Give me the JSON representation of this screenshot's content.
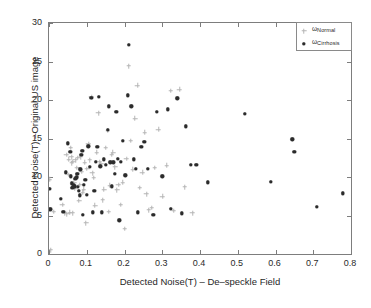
{
  "figure": {
    "background_color": "#ffffff",
    "axis_color": "#7d7d7d"
  },
  "legend": {
    "position": "top-right",
    "entries": [
      {
        "symbol": "ω",
        "subscript": "Normal",
        "marker": "plus-marker-light",
        "color": "#b4b4b4"
      },
      {
        "symbol": "ω",
        "subscript": "Cirrhosis",
        "marker": "dot-marker-dark",
        "color": "#2b2b2b"
      }
    ]
  },
  "axes": {
    "xlabel": "Detected Noise(T) – De–speckle Field",
    "ylabel": "Detected Noise(T) –Original US image",
    "xticklabels": [
      "0",
      "0.1",
      "0.2",
      "0.3",
      "0.4",
      "0.5",
      "0.6",
      "0.7",
      "0.8"
    ],
    "yticklabels": [
      "0",
      "5",
      "10",
      "15",
      "20",
      "25",
      "30"
    ]
  },
  "chart_data": {
    "type": "scatter",
    "title": "",
    "xlabel": "Detected Noise(T) – De–speckle Field",
    "ylabel": "Detected Noise(T) –Original US image",
    "xlim": [
      0,
      0.8
    ],
    "ylim": [
      0,
      30
    ],
    "xticks": [
      0,
      0.1,
      0.2,
      0.3,
      0.4,
      0.5,
      0.6,
      0.7,
      0.8
    ],
    "yticks": [
      0,
      5,
      10,
      15,
      20,
      25,
      30
    ],
    "grid": false,
    "legend_position": "upper right",
    "series": [
      {
        "name": "ω_Normal",
        "marker": "plus",
        "color": "#b4b4b4",
        "points": [
          [
            0.002,
            9.7
          ],
          [
            0.004,
            0.5
          ],
          [
            0.012,
            5.5
          ],
          [
            0.035,
            6.4
          ],
          [
            0.041,
            5.3
          ],
          [
            0.046,
            12.9
          ],
          [
            0.048,
            5.2
          ],
          [
            0.052,
            12.3
          ],
          [
            0.053,
            10.3
          ],
          [
            0.055,
            5.4
          ],
          [
            0.057,
            13.8
          ],
          [
            0.059,
            12.6
          ],
          [
            0.06,
            11.8
          ],
          [
            0.062,
            5.3
          ],
          [
            0.064,
            12.0
          ],
          [
            0.066,
            9.2
          ],
          [
            0.068,
            8.5
          ],
          [
            0.07,
            12.2
          ],
          [
            0.072,
            10.1
          ],
          [
            0.074,
            11.2
          ],
          [
            0.077,
            12.5
          ],
          [
            0.08,
            6.9
          ],
          [
            0.082,
            9.0
          ],
          [
            0.084,
            12.6
          ],
          [
            0.086,
            10.7
          ],
          [
            0.089,
            8.0
          ],
          [
            0.092,
            8.4
          ],
          [
            0.095,
            11.9
          ],
          [
            0.098,
            4.0
          ],
          [
            0.101,
            11.1
          ],
          [
            0.104,
            14.3
          ],
          [
            0.108,
            12.2
          ],
          [
            0.112,
            20.4
          ],
          [
            0.115,
            10.5
          ],
          [
            0.118,
            9.9
          ],
          [
            0.122,
            6.3
          ],
          [
            0.126,
            13.2
          ],
          [
            0.131,
            18.3
          ],
          [
            0.134,
            12.0
          ],
          [
            0.138,
            11.7
          ],
          [
            0.142,
            7.0
          ],
          [
            0.146,
            8.4
          ],
          [
            0.15,
            13.8
          ],
          [
            0.155,
            16.0
          ],
          [
            0.158,
            5.5
          ],
          [
            0.162,
            8.9
          ],
          [
            0.166,
            12.9
          ],
          [
            0.17,
            13.2
          ],
          [
            0.175,
            11.3
          ],
          [
            0.18,
            8.3
          ],
          [
            0.184,
            9.0
          ],
          [
            0.19,
            6.4
          ],
          [
            0.195,
            9.3
          ],
          [
            0.2,
            3.3
          ],
          [
            0.205,
            12.4
          ],
          [
            0.211,
            24.4
          ],
          [
            0.216,
            14.7
          ],
          [
            0.222,
            11.0
          ],
          [
            0.228,
            17.6
          ],
          [
            0.234,
            21.9
          ],
          [
            0.24,
            8.6
          ],
          [
            0.247,
            10.6
          ],
          [
            0.253,
            15.8
          ],
          [
            0.258,
            7.8
          ],
          [
            0.264,
            5.7
          ],
          [
            0.272,
            6.0
          ],
          [
            0.28,
            11.2
          ],
          [
            0.29,
            16.2
          ],
          [
            0.3,
            7.5
          ],
          [
            0.312,
            11.5
          ],
          [
            0.322,
            21.2
          ],
          [
            0.33,
            5.6
          ],
          [
            0.345,
            21.4
          ],
          [
            0.36,
            8.7
          ],
          [
            0.38,
            5.3
          ]
        ]
      },
      {
        "name": "ω_Cirrhosis",
        "marker": "dot",
        "color": "#2b2b2b",
        "points": [
          [
            0.001,
            8.5
          ],
          [
            0.003,
            5.8
          ],
          [
            0.032,
            7.2
          ],
          [
            0.038,
            5.5
          ],
          [
            0.044,
            10.6
          ],
          [
            0.05,
            14.4
          ],
          [
            0.056,
            13.3
          ],
          [
            0.058,
            10.1
          ],
          [
            0.06,
            9.2
          ],
          [
            0.062,
            8.6
          ],
          [
            0.064,
            8.7
          ],
          [
            0.066,
            8.9
          ],
          [
            0.068,
            8.8
          ],
          [
            0.07,
            9.8
          ],
          [
            0.072,
            9.9
          ],
          [
            0.074,
            10.0
          ],
          [
            0.075,
            10.4
          ],
          [
            0.077,
            8.7
          ],
          [
            0.079,
            8.2
          ],
          [
            0.081,
            7.6
          ],
          [
            0.083,
            11.0
          ],
          [
            0.086,
            12.9
          ],
          [
            0.088,
            13.4
          ],
          [
            0.09,
            5.1
          ],
          [
            0.093,
            9.0
          ],
          [
            0.096,
            9.6
          ],
          [
            0.1,
            7.7
          ],
          [
            0.104,
            14.0
          ],
          [
            0.108,
            11.3
          ],
          [
            0.112,
            20.3
          ],
          [
            0.116,
            5.4
          ],
          [
            0.12,
            8.2
          ],
          [
            0.124,
            12.0
          ],
          [
            0.128,
            13.9
          ],
          [
            0.132,
            20.4
          ],
          [
            0.136,
            11.4
          ],
          [
            0.14,
            5.4
          ],
          [
            0.145,
            12.3
          ],
          [
            0.15,
            11.6
          ],
          [
            0.155,
            16.1
          ],
          [
            0.158,
            19.2
          ],
          [
            0.162,
            11.9
          ],
          [
            0.166,
            8.8
          ],
          [
            0.17,
            11.9
          ],
          [
            0.174,
            10.4
          ],
          [
            0.178,
            18.5
          ],
          [
            0.182,
            12.4
          ],
          [
            0.186,
            4.4
          ],
          [
            0.19,
            12.0
          ],
          [
            0.196,
            14.7
          ],
          [
            0.202,
            10.2
          ],
          [
            0.208,
            20.6
          ],
          [
            0.212,
            27.2
          ],
          [
            0.218,
            19.2
          ],
          [
            0.224,
            12.3
          ],
          [
            0.23,
            11.1
          ],
          [
            0.236,
            5.4
          ],
          [
            0.244,
            13.9
          ],
          [
            0.252,
            14.6
          ],
          [
            0.262,
            11.1
          ],
          [
            0.276,
            5.1
          ],
          [
            0.286,
            18.5
          ],
          [
            0.3,
            10.1
          ],
          [
            0.314,
            18.8
          ],
          [
            0.322,
            5.9
          ],
          [
            0.34,
            20.2
          ],
          [
            0.352,
            5.3
          ],
          [
            0.362,
            16.6
          ],
          [
            0.375,
            11.6
          ],
          [
            0.39,
            11.6
          ],
          [
            0.42,
            9.3
          ],
          [
            0.518,
            18.2
          ],
          [
            0.588,
            9.4
          ],
          [
            0.645,
            14.9
          ],
          [
            0.65,
            13.3
          ],
          [
            0.71,
            6.1
          ],
          [
            0.778,
            7.9
          ]
        ]
      }
    ]
  }
}
